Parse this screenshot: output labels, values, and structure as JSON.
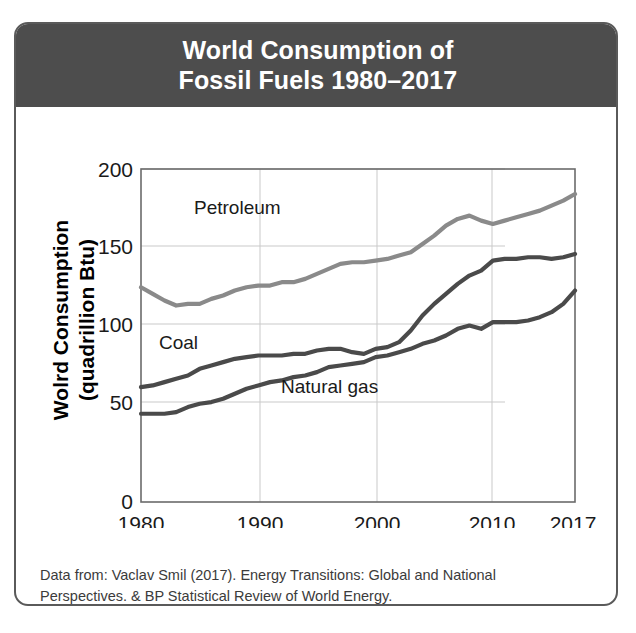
{
  "header": {
    "title_line1": "World Consumption of",
    "title_line2": "Fossil Fuels 1980–2017",
    "background_color": "#4d4d4d",
    "text_color": "#ffffff"
  },
  "axes": {
    "ylabel_line1": "Wolrd Consumption",
    "ylabel_line2": "(quadrillion Btu)",
    "xlabel": "Year",
    "yticks": [
      "0",
      "50",
      "100",
      "150",
      "200"
    ],
    "xticks": [
      "1980",
      "1990",
      "2000",
      "2010",
      "2017"
    ]
  },
  "series_labels": {
    "petroleum": "Petroleum",
    "coal": "Coal",
    "natural_gas": "Natural gas"
  },
  "caption": {
    "line1": "Data from: Vaclav Smil (2017). Energy Transitions: Global and National",
    "line2": "Perspectives. & BP Statistical Review of World Energy."
  },
  "chart_data": {
    "type": "line",
    "title": "World Consumption of Fossil Fuels 1980–2017",
    "xlabel": "Year",
    "ylabel": "Wolrd Consumption (quadrillion Btu)",
    "xlim": [
      1980,
      2017
    ],
    "ylim": [
      0,
      200
    ],
    "yticks": [
      0,
      50,
      100,
      150,
      200
    ],
    "xticks": [
      1980,
      1990,
      2000,
      2010,
      2017
    ],
    "grid": true,
    "legend": "inline-labels",
    "x": [
      1980,
      1981,
      1982,
      1983,
      1984,
      1985,
      1986,
      1987,
      1988,
      1989,
      1990,
      1991,
      1992,
      1993,
      1994,
      1995,
      1996,
      1997,
      1998,
      1999,
      2000,
      2001,
      2002,
      2003,
      2004,
      2005,
      2006,
      2007,
      2008,
      2009,
      2010,
      2011,
      2012,
      2013,
      2014,
      2015,
      2016,
      2017
    ],
    "series": [
      {
        "name": "Petroleum",
        "color": "#8a8a8a",
        "values": [
          129,
          125,
          121,
          118,
          119,
          119,
          122,
          124,
          127,
          129,
          130,
          130,
          132,
          132,
          134,
          137,
          140,
          143,
          144,
          144,
          145,
          146,
          148,
          150,
          155,
          160,
          166,
          170,
          172,
          169,
          167,
          169,
          171,
          173,
          175,
          178,
          181,
          185
        ]
      },
      {
        "name": "Coal",
        "color": "#4a4a4a",
        "values": [
          69,
          70,
          72,
          74,
          76,
          80,
          82,
          84,
          86,
          87,
          88,
          88,
          88,
          89,
          89,
          91,
          92,
          92,
          90,
          89,
          92,
          93,
          96,
          103,
          112,
          119,
          125,
          131,
          136,
          139,
          145,
          146,
          146,
          147,
          147,
          146,
          147,
          149
        ]
      },
      {
        "name": "Natural gas",
        "color": "#4a4a4a",
        "values": [
          53,
          53,
          53,
          54,
          57,
          59,
          60,
          62,
          65,
          68,
          70,
          72,
          73,
          75,
          76,
          78,
          81,
          82,
          83,
          84,
          87,
          88,
          90,
          92,
          95,
          97,
          100,
          104,
          106,
          104,
          108,
          108,
          108,
          109,
          111,
          114,
          119,
          127
        ]
      }
    ]
  }
}
